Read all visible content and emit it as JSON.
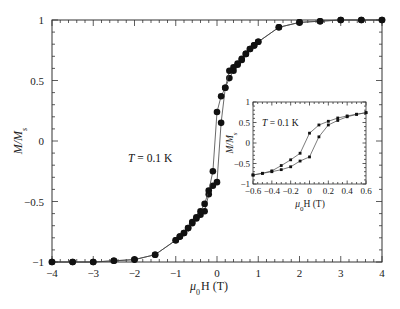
{
  "chart_data": [
    {
      "type": "line",
      "title": "",
      "xlabel": "μ0H (T)",
      "ylabel": "M/Ms",
      "xlim": [
        -4,
        4
      ],
      "ylim": [
        -1,
        1
      ],
      "xticks": [
        "-4",
        "-3",
        "-2",
        "-1",
        "0",
        "1",
        "2",
        "3",
        "4"
      ],
      "yticks": [
        "1",
        "0.5",
        "0",
        "-0.5",
        "-1"
      ],
      "grid": false,
      "annotation": "T = 0.1 K",
      "series": [
        {
          "name": "increasing field branch",
          "marker": "filled-circle",
          "x": [
            -4,
            -3.5,
            -3,
            -2.5,
            -2,
            -1.5,
            -1,
            -0.9,
            -0.8,
            -0.7,
            -0.6,
            -0.5,
            -0.4,
            -0.3,
            -0.2,
            -0.1,
            0,
            0.1,
            0.2,
            0.3,
            0.4,
            0.5,
            0.6,
            0.7,
            0.8,
            0.9,
            1,
            1.5,
            2,
            2.5,
            3,
            3.5,
            4
          ],
          "y": [
            -1,
            -1,
            -1,
            -0.99,
            -0.98,
            -0.94,
            -0.82,
            -0.79,
            -0.76,
            -0.72,
            -0.68,
            -0.64,
            -0.61,
            -0.58,
            -0.44,
            -0.37,
            -0.34,
            0.15,
            0.44,
            0.52,
            0.58,
            0.63,
            0.67,
            0.72,
            0.76,
            0.79,
            0.82,
            0.94,
            0.98,
            0.99,
            1,
            1,
            1
          ]
        },
        {
          "name": "decreasing field branch",
          "marker": "filled-circle",
          "x": [
            4,
            3.5,
            3,
            2.5,
            2,
            1.5,
            1,
            0.9,
            0.8,
            0.7,
            0.6,
            0.5,
            0.4,
            0.3,
            0.2,
            0.1,
            0,
            -0.1,
            -0.2,
            -0.3,
            -0.4,
            -0.5,
            -0.6,
            -0.7,
            -0.8,
            -0.9,
            -1,
            -1.5,
            -2,
            -2.5,
            -3,
            -3.5,
            -4
          ],
          "y": [
            1,
            1,
            1,
            0.99,
            0.98,
            0.94,
            0.82,
            0.79,
            0.76,
            0.72,
            0.68,
            0.64,
            0.61,
            0.58,
            0.44,
            0.37,
            0.24,
            -0.25,
            -0.41,
            -0.52,
            -0.58,
            -0.63,
            -0.67,
            -0.72,
            -0.76,
            -0.79,
            -0.82,
            -0.94,
            -0.98,
            -0.99,
            -1,
            -1,
            -1
          ]
        }
      ]
    },
    {
      "type": "line",
      "title": "inset",
      "xlabel": "μ0H (T)",
      "ylabel": "M/Ms",
      "xlim": [
        -0.6,
        0.6
      ],
      "ylim": [
        -1,
        1
      ],
      "xticks": [
        "-0.6",
        "-0.4",
        "-0.2",
        "0",
        "0.2",
        "0.4",
        "0.6"
      ],
      "yticks": [
        "1",
        "0.5",
        "0",
        "-0.5",
        "-1"
      ],
      "grid": false,
      "annotation": "T = 0.1 K",
      "series": [
        {
          "name": "increasing field branch",
          "marker": "small-filled-square",
          "x": [
            -0.6,
            -0.5,
            -0.4,
            -0.3,
            -0.2,
            -0.1,
            0,
            0.1,
            0.2,
            0.3,
            0.4,
            0.5,
            0.6
          ],
          "y": [
            -0.78,
            -0.74,
            -0.7,
            -0.65,
            -0.58,
            -0.44,
            -0.34,
            0.15,
            0.44,
            0.55,
            0.64,
            0.7,
            0.74
          ]
        },
        {
          "name": "decreasing field branch",
          "marker": "small-filled-square",
          "x": [
            0.6,
            0.5,
            0.4,
            0.3,
            0.2,
            0.1,
            0,
            -0.1,
            -0.2,
            -0.3,
            -0.4,
            -0.5,
            -0.6
          ],
          "y": [
            0.74,
            0.7,
            0.66,
            0.61,
            0.53,
            0.44,
            0.24,
            -0.25,
            -0.41,
            -0.55,
            -0.68,
            -0.74,
            -0.78
          ]
        }
      ]
    }
  ],
  "labels": {
    "main_xlabel_mu": "μ",
    "main_xlabel_sub": "0",
    "main_xlabel_rest": "H (T)",
    "ylabel_main": "M/M",
    "ylabel_sub": "s",
    "annotation": "T = 0.1 K",
    "annotation_T": "T",
    "annotation_rest": " = 0.1 K"
  }
}
